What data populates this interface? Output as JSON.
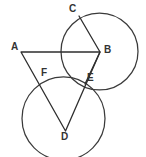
{
  "figure": {
    "background_color": "#ffffff",
    "stroke_color": "#3a3a3a",
    "label_color": "#333333",
    "width": 146,
    "height": 157
  },
  "labels": [
    {
      "id": "C",
      "text": "C",
      "x": 69,
      "y": 4
    },
    {
      "id": "B",
      "text": "B",
      "x": 104,
      "y": 45
    },
    {
      "id": "A",
      "text": "A",
      "x": 11,
      "y": 42
    },
    {
      "id": "F",
      "text": "F",
      "x": 41,
      "y": 68
    },
    {
      "id": "E",
      "text": "E",
      "x": 87,
      "y": 73
    },
    {
      "id": "D",
      "text": "D",
      "x": 61,
      "y": 132
    }
  ],
  "points": [
    {
      "id": "A",
      "x": 21,
      "y": 52
    },
    {
      "id": "B",
      "x": 100,
      "y": 52
    },
    {
      "id": "C",
      "x": 79,
      "y": 16
    },
    {
      "id": "D",
      "x": 65.5,
      "y": 131
    },
    {
      "id": "E",
      "x": 85,
      "y": 84
    },
    {
      "id": "F",
      "x": 41,
      "y": 80
    }
  ],
  "circles": [
    {
      "id": "circle-upper-right",
      "cx": 99.5,
      "cy": 51.5,
      "r": 38.5
    },
    {
      "id": "circle-lower-left",
      "cx": 63.5,
      "cy": 118.5,
      "r": 41.5
    }
  ],
  "segments": [
    {
      "id": "segment-AB",
      "from": "A",
      "to": "B"
    },
    {
      "id": "segment-AD",
      "from": "A",
      "to": "D"
    },
    {
      "id": "segment-BD",
      "from": "B",
      "to": "D"
    },
    {
      "id": "segment-CB",
      "from": "C",
      "to": "B"
    },
    {
      "id": "segment-BE",
      "from": "B",
      "to": "E"
    }
  ],
  "paths": {
    "circle_upper_right": "M 138,51.5 A 38.5,38.5 0 1 1 61,51.5 A 38.5,38.5 0 1 1 138,51.5 Z",
    "circle_lower_left": "M 105,118.5 A 41.5,41.5 0 1 1 22,118.5 A 41.5,41.5 0 1 1 105,118.5 Z",
    "triangle_ABD": "M 21,52 L 100,52 L 65.5,131 Z",
    "zigzag_CBE": "M 79,16 L 100,52 L 85,84"
  }
}
